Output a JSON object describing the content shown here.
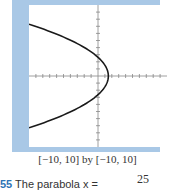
{
  "chart_data": {
    "type": "line",
    "title": "",
    "xlabel": "",
    "ylabel": "",
    "xlim": [
      -10,
      10
    ],
    "ylim": [
      -10,
      10
    ],
    "grid": false,
    "tick_step": 1,
    "series": [
      {
        "name": "parabola (opens left)",
        "equation_approx": "x = 1.5 - 0.21*y^2",
        "vertex": [
          1.5,
          0
        ],
        "points": [
          [
            -10,
            7.3
          ],
          [
            -6,
            5.8
          ],
          [
            -3,
            4.3
          ],
          [
            0,
            2.7
          ],
          [
            1.5,
            0
          ],
          [
            0,
            -2.7
          ],
          [
            -3,
            -4.3
          ],
          [
            -6,
            -5.8
          ],
          [
            -10,
            -7.3
          ]
        ]
      }
    ]
  },
  "caption": "[−10, 10] by [−10, 10]",
  "problem": {
    "number": "55",
    "text": "The parabola x ="
  },
  "fraction_numerator": "25",
  "colors": {
    "frame": "#a9c8e6",
    "problem_number": "#2e74b5",
    "curve": "#1a1a1a"
  }
}
